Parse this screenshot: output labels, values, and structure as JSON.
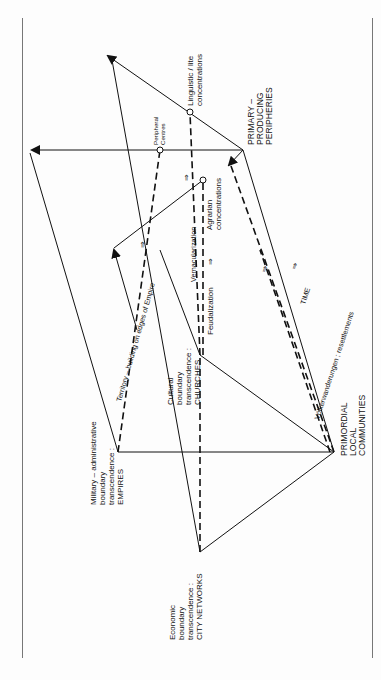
{
  "diagram": {
    "nodes": {
      "empires": [
        "Military – administrative",
        "boundary",
        "transcendence :",
        "EMPIRES"
      ],
      "city_networks": [
        "Economic",
        "boundary",
        "transcendence :",
        "CITY NETWORKS"
      ],
      "churches": [
        "Cultural",
        "boundary",
        "transcendence :",
        "CHURCHES"
      ],
      "primordial": [
        "PRIMORDIAL",
        "LOCAL",
        "COMMUNITIES"
      ],
      "primary": [
        "PRIMARY –",
        "PRODUCING",
        "PERIPHERIES"
      ],
      "linguistic": [
        "Linguistic / lite",
        "concentrations"
      ],
      "peripheral": [
        "Peripheral",
        "Centres"
      ],
      "agrarian": [
        "Agrarian",
        "concentrations"
      ]
    },
    "edge_labels": {
      "territory": "Territory – building on edges of Empire",
      "vernacularization": "Vernacularization",
      "feudalization": "Feudalization",
      "volkerwanderungen": "Völkerwanderungen ; resettlements",
      "time": "TIME",
      "arrow": "⇒"
    }
  }
}
